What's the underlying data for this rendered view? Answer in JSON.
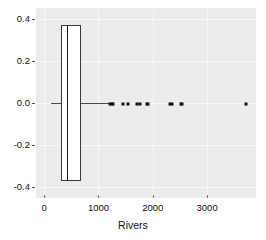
{
  "chart_data": {
    "type": "box",
    "orientation": "horizontal",
    "title": "",
    "xlabel": "Rivers",
    "ylabel": "",
    "xlim": [
      -150,
      3900
    ],
    "ylim": [
      -0.45,
      0.45
    ],
    "grid": true,
    "grid_color": "#f7f7f7",
    "panel_background": "#ececec",
    "box_fill": "#ffffff",
    "box_line_color": "#3a3a3a",
    "point_color": "#111111",
    "xticks": [
      {
        "value": 0,
        "label": "0"
      },
      {
        "value": 1000,
        "label": "1000"
      },
      {
        "value": 2000,
        "label": "2000"
      },
      {
        "value": 3000,
        "label": "3000"
      }
    ],
    "yticks": [
      {
        "value": 0.4,
        "label": "0.4"
      },
      {
        "value": 0.2,
        "label": "0.2"
      },
      {
        "value": 0.0,
        "label": "0.0"
      },
      {
        "value": -0.2,
        "label": "-0.2"
      },
      {
        "value": -0.4,
        "label": "-0.4"
      }
    ],
    "box": {
      "center": 0.0,
      "half_height": 0.37,
      "lower_whisker": 135,
      "q1": 310,
      "median": 425,
      "q3": 680,
      "upper_whisker": 680
    },
    "outliers": [
      1205,
      1240,
      1270,
      1450,
      1540,
      1710,
      1770,
      1885,
      1905,
      2315,
      2350,
      2525,
      2540,
      3710
    ]
  },
  "axis": {
    "x_label": "Rivers"
  }
}
